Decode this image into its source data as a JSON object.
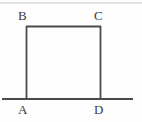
{
  "figure": {
    "background_color": "#fefefe",
    "stroke_color": "#4a4a4a",
    "faint_line_color": "#d8d8d8",
    "label_color": "#3a3a3a",
    "labels": {
      "a": "A",
      "b": "B",
      "c": "C",
      "d": "D"
    },
    "vertices": [
      {
        "name": "A",
        "x": 26,
        "y": 99
      },
      {
        "name": "B",
        "x": 26,
        "y": 26
      },
      {
        "name": "C",
        "x": 100,
        "y": 26
      },
      {
        "name": "D",
        "x": 100,
        "y": 99
      }
    ],
    "baseline": {
      "x1": 2,
      "y1": 99,
      "x2": 133,
      "y2": 99
    },
    "top_rule": {
      "x1": 0,
      "y1": 3,
      "x2": 142,
      "y2": 3
    }
  }
}
